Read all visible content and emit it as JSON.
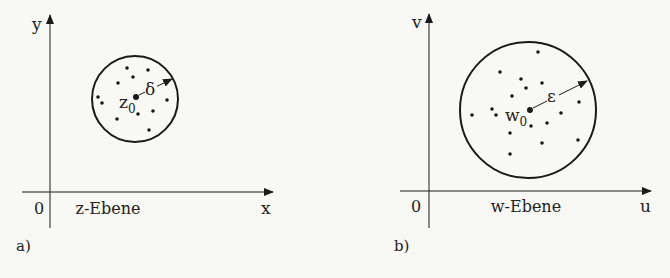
{
  "colors": {
    "background": "#f8f8f5",
    "ink": "#1a1a1a"
  },
  "panels": [
    {
      "id": "a",
      "caption": "a)",
      "plane_label": "z-Ebene",
      "origin_label": "0",
      "x_axis_label": "x",
      "y_axis_label": "y",
      "center_label": "z",
      "center_subscript": "0",
      "radius_label": "δ",
      "circle": {
        "cx": 135,
        "cy": 99,
        "r": 43
      },
      "center": {
        "x": 136,
        "y": 97
      },
      "points": [
        [
          127,
          68
        ],
        [
          148,
          70
        ],
        [
          133,
          77
        ],
        [
          118,
          83
        ],
        [
          98,
          97
        ],
        [
          102,
          103
        ],
        [
          167,
          100
        ],
        [
          138,
          114
        ],
        [
          153,
          111
        ],
        [
          117,
          119
        ],
        [
          149,
          130
        ]
      ]
    },
    {
      "id": "b",
      "caption": "b)",
      "plane_label": "w-Ebene",
      "origin_label": "0",
      "x_axis_label": "u",
      "y_axis_label": "v",
      "center_label": "w",
      "center_subscript": "0",
      "radius_label": "ε",
      "circle": {
        "cx": 528,
        "cy": 110,
        "r": 68
      },
      "center": {
        "x": 530,
        "y": 110
      },
      "points": [
        [
          538,
          52
        ],
        [
          500,
          72
        ],
        [
          521,
          79
        ],
        [
          542,
          83
        ],
        [
          526,
          88
        ],
        [
          512,
          96
        ],
        [
          579,
          102
        ],
        [
          492,
          109
        ],
        [
          472,
          115
        ],
        [
          496,
          115
        ],
        [
          561,
          113
        ],
        [
          531,
          126
        ],
        [
          547,
          123
        ],
        [
          510,
          133
        ],
        [
          578,
          140
        ],
        [
          542,
          143
        ],
        [
          510,
          154
        ]
      ]
    }
  ]
}
